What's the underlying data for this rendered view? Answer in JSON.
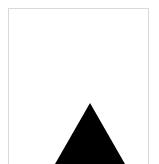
{
  "canvas": {
    "width": 159,
    "height": 164,
    "background_color": "#ffffff",
    "label": "shape canvas"
  },
  "panel": {
    "label": "bordered panel",
    "border_color": "#d9d9d9",
    "border_width": 1,
    "inset_left": 8,
    "inset_top": 8,
    "inset_right": 10,
    "bottom_edge": "open",
    "fill_color": "#ffffff"
  },
  "shapes": [
    {
      "id": "triangle-1",
      "type": "triangle",
      "label": "solid black triangle",
      "fill_color": "#000000",
      "stroke": "none",
      "apex": {
        "x": 89,
        "y": 102
      },
      "base_left": {
        "x": 50,
        "y": 170
      },
      "base_right": {
        "x": 128,
        "y": 170
      },
      "clipped_by": "canvas-bottom",
      "orientation": "pointing-up"
    }
  ],
  "content": {
    "text_items": [],
    "note": ""
  }
}
